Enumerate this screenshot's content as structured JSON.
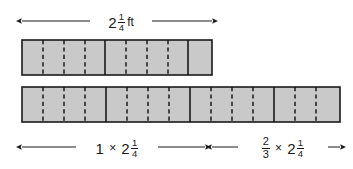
{
  "diagram": {
    "colors": {
      "bar_fill": "#c9c9c9",
      "stroke": "#1a1a1a",
      "background": "#ffffff"
    },
    "top_label": {
      "whole": "2",
      "numerator": "1",
      "denominator": "4",
      "unit": "ft"
    },
    "bottom_left_label": {
      "factor": "1",
      "operator": "×",
      "whole": "2",
      "numerator": "1",
      "denominator": "4"
    },
    "bottom_right_label": {
      "factor_numerator": "2",
      "factor_denominator": "3",
      "operator": "×",
      "whole": "2",
      "numerator": "1",
      "denominator": "4"
    },
    "bars": [
      {
        "name": "bar-top",
        "x": 22,
        "y": 40,
        "width": 190,
        "height": 35,
        "unit_dividers": [
          105,
          188
        ],
        "quarter_dividers": [
          43,
          64,
          85,
          126,
          147,
          168,
          209
        ]
      },
      {
        "name": "bar-bottom",
        "x": 22,
        "y": 87,
        "width": 318,
        "height": 35,
        "unit_dividers": [
          106,
          190,
          274
        ],
        "quarter_dividers": [
          43,
          64,
          85,
          127,
          148,
          169,
          211,
          232,
          253,
          295,
          316,
          337
        ]
      }
    ],
    "arrows": [
      {
        "name": "top-measure-arrow",
        "x1": 22,
        "x2": 212,
        "y": 21
      },
      {
        "name": "bottom-left-arrow",
        "x1": 22,
        "x2": 205,
        "y": 147
      },
      {
        "name": "bottom-right-arrow",
        "x1": 212,
        "x2": 340,
        "y": 147
      }
    ]
  }
}
